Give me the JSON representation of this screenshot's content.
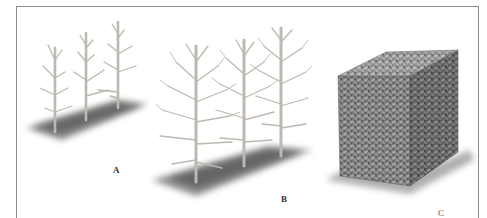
{
  "figure": {
    "panels": [
      {
        "id": "A",
        "label": "A",
        "subject": "three young pruned saplings on a strip of ground"
      },
      {
        "id": "B",
        "label": "B",
        "subject": "three branching trees on a strip of ground"
      },
      {
        "id": "C",
        "label": "C",
        "subject": "dense clipped hedge block"
      }
    ]
  },
  "colors": {
    "frame": "#8a8a8a",
    "bark": "#c9c4bc",
    "bark_shade": "#8f8a84",
    "ground": "#5a5a5a",
    "foliage": "#6b6b6b",
    "foliage_light": "#a8a8a8",
    "label": "#333333"
  }
}
